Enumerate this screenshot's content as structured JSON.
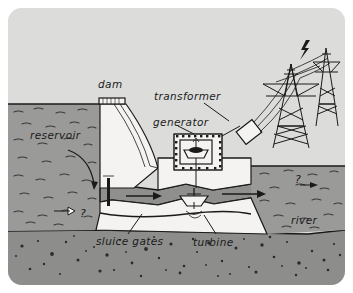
{
  "figure": {
    "kind": "cross-section-diagram",
    "style": "hand-drawn grayscale line illustration",
    "card_background": "#e8e8e6"
  },
  "labels": {
    "dam": "dam",
    "reservoir": "reservoir",
    "transformer": "transformer",
    "generator": "generator",
    "sluice_gates": "sluice gates",
    "turbine": "turbine",
    "river": "river"
  },
  "annotations": {
    "question_reservoir": "?",
    "question_river": "?",
    "lightning": "lightning-bolt"
  },
  "palette": {
    "ink": "#1a1a1a",
    "sky": "#dcdcda",
    "water": "#9a9a98",
    "water_shadow": "#8f8f8d",
    "bedrock": "#8d8d8b",
    "concrete": "#f4f3f1"
  },
  "components": [
    {
      "name": "dam",
      "type": "structure"
    },
    {
      "name": "reservoir",
      "type": "water-body"
    },
    {
      "name": "sluice gates",
      "type": "structure"
    },
    {
      "name": "turbine",
      "type": "machine"
    },
    {
      "name": "generator",
      "type": "machine"
    },
    {
      "name": "transformer",
      "type": "machine"
    },
    {
      "name": "transmission towers",
      "type": "structure",
      "count": 2
    },
    {
      "name": "river",
      "type": "water-body"
    },
    {
      "name": "bedrock",
      "type": "ground"
    }
  ]
}
